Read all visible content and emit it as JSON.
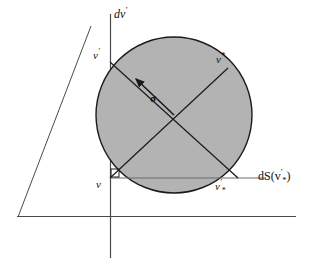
{
  "figure": {
    "background_color": "#ffffff",
    "disk_fill_color": "#b3b3b3",
    "line_color": "#1a1a1a",
    "axis_color": "#555555",
    "labels": {
      "axis_y": "dv'",
      "axis_x": "dS(v'*)",
      "v_prime": "v'",
      "v_star": "v*",
      "v": "v",
      "v_prime_star": "v'*",
      "sigma": "σ"
    },
    "label_parts": {
      "axis_y_base": "dv",
      "axis_y_prime": "'",
      "axis_x_open": "dS(v",
      "axis_x_prime": "'",
      "axis_x_star": "*",
      "axis_x_close": ")",
      "v_prime_base": "v",
      "v_prime_mark": "'",
      "v_star_base": "v",
      "v_star_mark": "*",
      "v_base": "v",
      "v_prime_star_base": "v",
      "v_prime_star_prime": "'",
      "v_prime_star_star": "*"
    },
    "geometry": {
      "circle_center_x": 174,
      "circle_center_y": 115,
      "circle_radius": 78,
      "axis_vertical_x": 110,
      "axis_vertical_top_y": 14,
      "axis_vertical_bottom_y": 258,
      "chord_horizontal_y": 178,
      "chord_horizontal_x1": 110,
      "chord_horizontal_x2": 266,
      "wedge_apex_x": 91,
      "wedge_apex_y": 26,
      "wedge_corner_x": 18,
      "wedge_corner_y": 217,
      "baseline_x2": 296,
      "point_v_prime": [
        110,
        62
      ],
      "point_v_star": [
        228,
        68
      ],
      "point_v": [
        110,
        178
      ],
      "point_v_prime_star": [
        238,
        178
      ],
      "sigma_arrow_from": [
        174,
        115
      ],
      "sigma_arrow_to": [
        133,
        76
      ],
      "right_angle_marker": [
        111,
        170
      ]
    }
  }
}
